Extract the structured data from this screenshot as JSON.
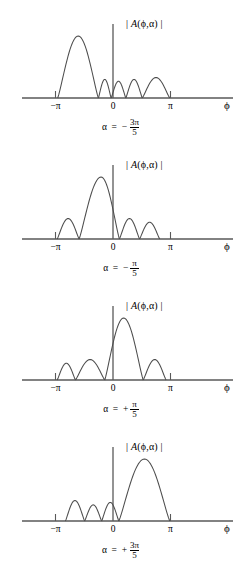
{
  "figure": {
    "title": "",
    "background": "#ffffff",
    "curve_color": "#4d4d4d",
    "axis_color": "#595959"
  },
  "axis": {
    "ylabel": "| A(ϕ,α) |",
    "ylabel_open": "|",
    "ylabel_A": "A",
    "ylabel_args": "(ϕ,α)",
    "ylabel_close": "|",
    "xlabel": "ϕ",
    "ticks": [
      {
        "label": "−π",
        "value": -3.14159
      },
      {
        "label": "0",
        "value": 0
      },
      {
        "label": "π",
        "value": 3.14159
      }
    ]
  },
  "panels": [
    {
      "id": "panel-1",
      "alpha_prefix": "α  =  −",
      "alpha_num": "3π",
      "alpha_den": "5",
      "alpha_text": "α = − 3π/5",
      "alpha_value": -1.88496,
      "main_lobe": {
        "start": -3.02,
        "end": -0.8,
        "peak_x": -1.9,
        "height": 1.0
      },
      "side_lobes": [
        {
          "start": -0.8,
          "end": -0.1,
          "peak_x": -0.45,
          "height": 0.3
        },
        {
          "start": -0.1,
          "end": 0.7,
          "peak_x": 0.3,
          "height": 0.27
        },
        {
          "start": 0.7,
          "end": 1.6,
          "peak_x": 1.15,
          "height": 0.3
        },
        {
          "start": 1.6,
          "end": 3.1,
          "peak_x": 2.35,
          "height": 0.33
        }
      ]
    },
    {
      "id": "panel-2",
      "alpha_prefix": "α  =  −",
      "alpha_num": "π",
      "alpha_den": "5",
      "alpha_text": "α = − π/5",
      "alpha_value": -0.62832,
      "main_lobe": {
        "start": -1.85,
        "end": 0.35,
        "peak_x": -0.65,
        "height": 1.0
      },
      "side_lobes": [
        {
          "start": -3.05,
          "end": -1.85,
          "peak_x": -2.45,
          "height": 0.33
        },
        {
          "start": 0.35,
          "end": 1.45,
          "peak_x": 0.9,
          "height": 0.33
        },
        {
          "start": 1.45,
          "end": 2.55,
          "peak_x": 2.0,
          "height": 0.27
        }
      ]
    },
    {
      "id": "panel-3",
      "alpha_prefix": "α  =  +",
      "alpha_num": "π",
      "alpha_den": "5",
      "alpha_text": "α = + π/5",
      "alpha_value": 0.62832,
      "main_lobe": {
        "start": -0.45,
        "end": 1.65,
        "peak_x": 0.58,
        "height": 1.0
      },
      "side_lobes": [
        {
          "start": -3.05,
          "end": -2.05,
          "peak_x": -2.55,
          "height": 0.27
        },
        {
          "start": -2.05,
          "end": -0.45,
          "peak_x": -1.25,
          "height": 0.33
        },
        {
          "start": 1.65,
          "end": 2.9,
          "peak_x": 2.28,
          "height": 0.33
        }
      ]
    },
    {
      "id": "panel-4",
      "alpha_prefix": "α  =  +",
      "alpha_num": "3π",
      "alpha_den": "5",
      "alpha_text": "α = + 3π/5",
      "alpha_value": 1.88496,
      "main_lobe": {
        "start": 0.32,
        "end": 3.1,
        "peak_x": 1.72,
        "height": 1.0
      },
      "side_lobes": [
        {
          "start": -2.6,
          "end": -1.55,
          "peak_x": -2.08,
          "height": 0.33
        },
        {
          "start": -1.55,
          "end": -0.62,
          "peak_x": -1.08,
          "height": 0.26
        },
        {
          "start": -0.62,
          "end": 0.32,
          "peak_x": -0.15,
          "height": 0.3
        }
      ]
    }
  ]
}
